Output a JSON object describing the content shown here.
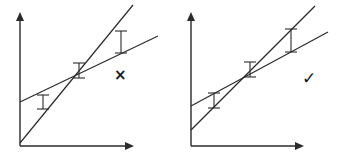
{
  "colors": {
    "ink": "#2a2a2a",
    "background": "#ffffff"
  },
  "panels": [
    {
      "id": "left",
      "verdict_symbol": "×",
      "verdict_meaning": "incorrect",
      "axes": {
        "origin": [
          20,
          146
        ],
        "y_top": 13,
        "x_right": 133
      },
      "lines": [
        {
          "name": "steep-line",
          "from": [
            20,
            143
          ],
          "to": [
            133,
            5
          ]
        },
        {
          "name": "shallow-line",
          "from": [
            20,
            102
          ],
          "to": [
            158,
            36
          ]
        }
      ],
      "error_bars": [
        {
          "x": 43,
          "y_top": 95,
          "y_bottom": 109
        },
        {
          "x": 79,
          "y_top": 63,
          "y_bottom": 78
        },
        {
          "x": 121,
          "y_top": 31,
          "y_bottom": 53
        }
      ]
    },
    {
      "id": "right",
      "verdict_symbol": "✓",
      "verdict_meaning": "correct",
      "axes": {
        "origin": [
          191,
          146
        ],
        "y_top": 13,
        "x_right": 303
      },
      "lines": [
        {
          "name": "steep-line",
          "from": [
            191,
            130
          ],
          "to": [
            315,
            6
          ]
        },
        {
          "name": "shallow-line",
          "from": [
            191,
            106
          ],
          "to": [
            328,
            32
          ]
        }
      ],
      "error_bars": [
        {
          "x": 214,
          "y_top": 93,
          "y_bottom": 108
        },
        {
          "x": 250,
          "y_top": 62,
          "y_bottom": 77
        },
        {
          "x": 291,
          "y_top": 29,
          "y_bottom": 52
        }
      ]
    }
  ]
}
